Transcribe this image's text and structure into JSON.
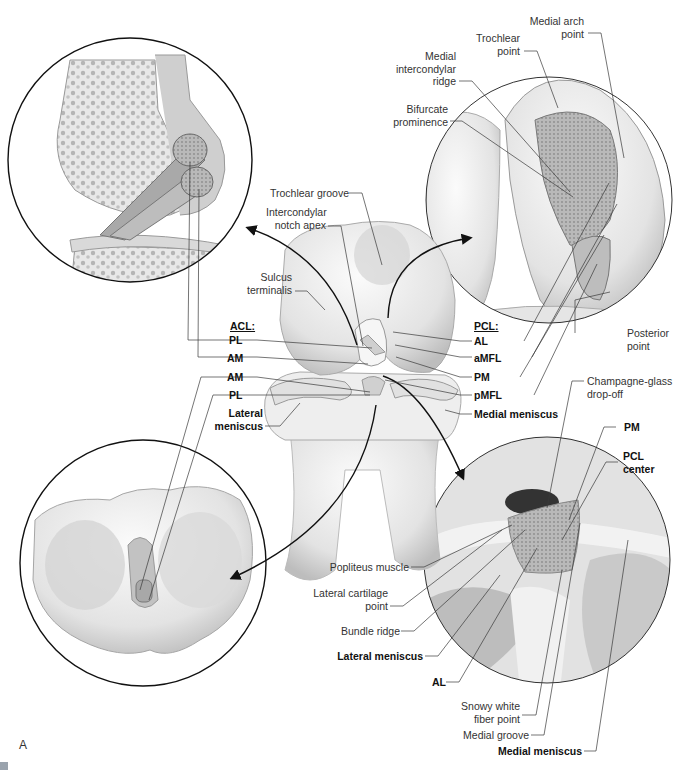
{
  "figure": {
    "panel_letter": "A",
    "insets": [
      {
        "name": "lateral-sagittal-view",
        "position": "top-left"
      },
      {
        "name": "pcl-femoral-footprint-view",
        "position": "top-right"
      },
      {
        "name": "tibial-plateau-view",
        "position": "bottom-left"
      },
      {
        "name": "pcl-tibial-footprint-view",
        "position": "bottom-right"
      }
    ],
    "center": {
      "labels": {
        "trochlear_groove": "Trochlear groove",
        "intercondylar_notch_apex_1": "Intercondylar",
        "intercondylar_notch_apex_2": "notch apex",
        "sulcus_terminalis_1": "Sulcus",
        "sulcus_terminalis_2": "terminalis",
        "acl_header": "ACL:",
        "acl_pl_femoral": "PL",
        "acl_am_femoral": "AM",
        "acl_am_tibial": "AM",
        "acl_pl_tibial": "PL",
        "lateral_meniscus_1": "Lateral",
        "lateral_meniscus_2": "meniscus",
        "pcl_header": "PCL:",
        "pcl_al": "AL",
        "pcl_amfl": "aMFL",
        "pcl_pm": "PM",
        "pcl_pmfl": "pMFL",
        "medial_meniscus": "Medial meniscus"
      }
    },
    "top_right": {
      "labels": {
        "medial_arch_point_1": "Medial arch",
        "medial_arch_point_2": "point",
        "trochlear_point_1": "Trochlear",
        "trochlear_point_2": "point",
        "medial_intercondylar_ridge_1": "Medial",
        "medial_intercondylar_ridge_2": "intercondylar",
        "medial_intercondylar_ridge_3": "ridge",
        "bifurcate_prominence_1": "Bifurcate",
        "bifurcate_prominence_2": "prominence",
        "posterior_point_1": "Posterior",
        "posterior_point_2": "point"
      }
    },
    "bottom_right": {
      "labels": {
        "champagne_glass_1": "Champagne-glass",
        "champagne_glass_2": "drop-off",
        "pm": "PM",
        "pcl_center_1": "PCL",
        "pcl_center_2": "center",
        "popliteus_muscle": "Popliteus muscle",
        "lateral_cartilage_point_1": "Lateral cartilage",
        "lateral_cartilage_point_2": "point",
        "bundle_ridge": "Bundle ridge",
        "lateral_meniscus": "Lateral meniscus",
        "al": "AL",
        "snowy_white_1": "Snowy white",
        "snowy_white_2": "fiber point",
        "medial_groove": "Medial groove",
        "medial_meniscus": "Medial meniscus"
      }
    },
    "colors": {
      "ink": "#231f20",
      "leader": "#3a3a3a",
      "bone_light": "#f2f2f2",
      "bone_mid": "#d6d6d6",
      "bone_dark": "#9a9a9a",
      "footprint": "#b8b8b8"
    }
  }
}
